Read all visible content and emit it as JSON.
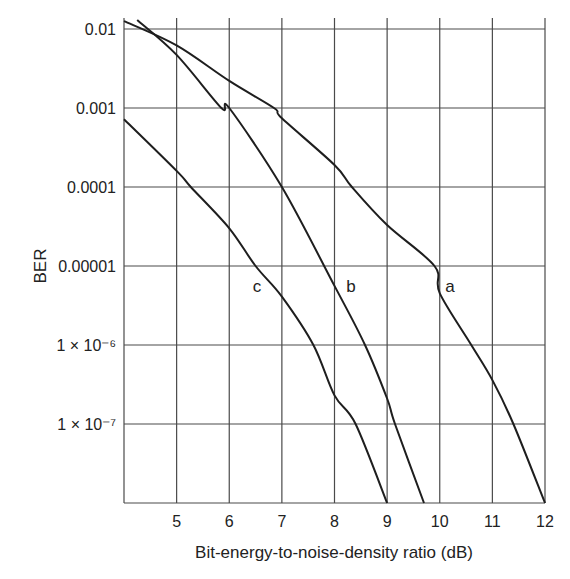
{
  "chart_data": {
    "type": "line",
    "title": "",
    "xlabel": "Bit-energy-to-noise-density ratio (dB)",
    "ylabel": "BER",
    "xscale": "linear",
    "yscale": "log",
    "xlim": [
      4,
      12
    ],
    "ylim": [
      1e-08,
      0.012
    ],
    "grid": true,
    "legend": "inline curve labels",
    "x_ticks": [
      5,
      6,
      7,
      8,
      9,
      10,
      11,
      12
    ],
    "x_tick_labels": [
      "5",
      "6",
      "7",
      "8",
      "9",
      "10",
      "11",
      "12"
    ],
    "y_ticks": [
      0.01,
      0.001,
      0.0001,
      1e-05,
      1e-06,
      1e-07
    ],
    "y_tick_labels": [
      "0.01",
      "0.001",
      "0.0001",
      "0.00001",
      "1 × 10⁻⁶",
      "1 × 10⁻⁷"
    ],
    "series": [
      {
        "name": "a",
        "x": [
          4.0,
          5.0,
          6.0,
          6.85,
          7.0,
          8.0,
          8.33,
          9.0,
          9.9,
          10.0,
          10.6,
          11.0,
          11.4,
          12.0
        ],
        "values": [
          0.0126,
          0.0062,
          0.0022,
          0.001,
          0.00074,
          0.00019,
          0.0001,
          3.3e-05,
          1e-05,
          4.5e-06,
          1e-06,
          3.6e-07,
          1e-07,
          1e-08
        ]
      },
      {
        "name": "b",
        "x": [
          4.25,
          5.0,
          5.85,
          6.0,
          7.0,
          8.0,
          8.58,
          9.0,
          9.15,
          9.7
        ],
        "values": [
          0.013,
          0.0047,
          0.001,
          0.001,
          0.0001,
          5.6e-06,
          1e-06,
          2.1e-07,
          1e-07,
          1e-08
        ]
      },
      {
        "name": "c",
        "x": [
          4.0,
          5.0,
          5.27,
          6.0,
          6.5,
          7.0,
          7.6,
          8.0,
          8.4,
          9.0
        ],
        "values": [
          0.00072,
          0.00016,
          0.0001,
          3e-05,
          1e-05,
          4.1e-06,
          1e-06,
          2.3e-07,
          1e-07,
          1e-08
        ]
      }
    ],
    "annotations": [
      {
        "text": "a",
        "x": 10.2,
        "y": 4e-06
      },
      {
        "text": "b",
        "x": 8.3,
        "y": 4e-06
      },
      {
        "text": "c",
        "x": 6.5,
        "y": 4e-06
      }
    ]
  }
}
